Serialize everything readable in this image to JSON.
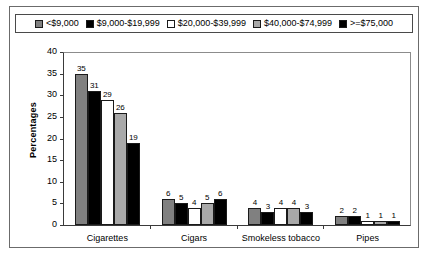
{
  "chart_data": {
    "type": "bar",
    "title": "",
    "xlabel": "",
    "ylabel": "Percentages",
    "ylim": [
      0,
      40
    ],
    "yticks": [
      0,
      5,
      10,
      15,
      20,
      25,
      30,
      35,
      40
    ],
    "grid": false,
    "legend_position": "top",
    "categories": [
      "Cigarettes",
      "Cigars",
      "Smokeless tobacco",
      "Pipes"
    ],
    "series": [
      {
        "name": "<$9,000",
        "color": "#808080",
        "values": [
          35,
          6,
          4,
          2
        ]
      },
      {
        "name": "$9,000-$19,999",
        "color": "#000000",
        "values": [
          31,
          5,
          3,
          2
        ]
      },
      {
        "name": "$20,000-$39,999",
        "color": "#ffffff",
        "values": [
          29,
          4,
          4,
          1
        ]
      },
      {
        "name": "$40,000-$74,999",
        "color": "#a9a9a9",
        "values": [
          26,
          5,
          4,
          1
        ]
      },
      {
        "name": ">=$75,000",
        "color": "#000000",
        "values": [
          19,
          6,
          3,
          1
        ]
      }
    ]
  },
  "colors": {
    "plot_background": "#ffffff",
    "figure_border": "#6b6b6b",
    "axis": "#3a3a3a",
    "text": "#000000"
  }
}
